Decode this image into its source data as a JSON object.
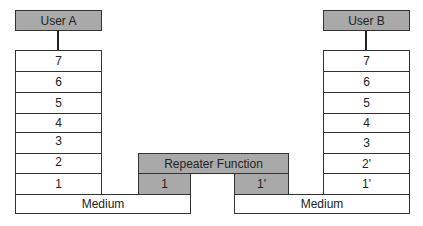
{
  "diagram": {
    "user_a": {
      "label": "User A",
      "layers": [
        "7",
        "6",
        "5",
        "4",
        "3",
        "2",
        "1"
      ]
    },
    "user_b": {
      "label": "User B",
      "layers": [
        "7",
        "6",
        "5",
        "4",
        "3",
        "2'",
        "1'"
      ]
    },
    "repeater": {
      "label": "Repeater Function",
      "left_layer": "1",
      "right_layer": "1'"
    },
    "medium_left": "Medium",
    "medium_right": "Medium",
    "colors": {
      "header_fill": "#a9a9a9",
      "layer_fill": "#ffffff",
      "border": "#333333"
    }
  }
}
